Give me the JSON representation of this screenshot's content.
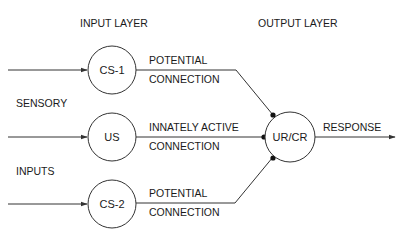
{
  "diagram": {
    "headings": {
      "input_layer": "INPUT LAYER",
      "output_layer": "OUTPUT LAYER"
    },
    "side_labels": {
      "line1": "SENSORY",
      "line2": "INPUTS"
    },
    "nodes": {
      "cs1": "CS-1",
      "us": "US",
      "cs2": "CS-2",
      "urcr": "UR/CR"
    },
    "connections": {
      "cs1": {
        "line1": "POTENTIAL",
        "line2": "CONNECTION"
      },
      "us": {
        "line1": "INNATELY ACTIVE",
        "line2": "CONNECTION"
      },
      "cs2": {
        "line1": "POTENTIAL",
        "line2": "CONNECTION"
      }
    },
    "output_label": "RESPONSE",
    "colors": {
      "stroke": "#333333",
      "text": "#1a1a1a",
      "background": "#ffffff"
    }
  }
}
